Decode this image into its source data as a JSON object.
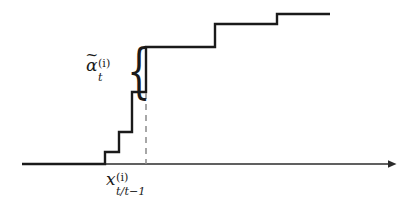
{
  "figure": {
    "background_color": "#ffffff",
    "line_color": "#1a1a1a",
    "dashed_line_color": "#7a7a7a",
    "axis_color": "#2b2b2b"
  },
  "labels": {
    "alpha": {
      "name": "alpha-tilde-label",
      "base": "α",
      "accent": "~",
      "subscript": "t",
      "superscript": "(i)",
      "plain": "α̃_t^(i)"
    },
    "x_pred": {
      "name": "x-predicted-label",
      "base": "x",
      "subscript": "t/t−1",
      "superscript": "(i)",
      "plain": "x_{t/t−1}^{(i)}"
    }
  },
  "brace": {
    "name": "curly-brace",
    "glyph": "{",
    "top_y": 47,
    "bottom_y": 93
  },
  "chart_data": {
    "type": "line",
    "xlabel": "",
    "ylabel": "",
    "grid": false,
    "legend": false,
    "axis": {
      "x_start": 22,
      "x_end": 396,
      "y": 164,
      "arrow": true
    },
    "marked_x": {
      "label": "x_{t/t−1}^{(i)}",
      "pixel_x": 146,
      "dashed_from_y": 92,
      "dashed_to_y": 164
    },
    "highlighted_jump": {
      "label": "α̃_t^(i)",
      "from_y": 92,
      "to_y": 47,
      "at_x": 146
    },
    "step_points_px": [
      [
        22,
        164
      ],
      [
        105,
        164
      ],
      [
        105,
        152
      ],
      [
        119,
        152
      ],
      [
        119,
        132
      ],
      [
        132,
        132
      ],
      [
        132,
        92
      ],
      [
        146,
        92
      ],
      [
        146,
        47
      ],
      [
        215,
        47
      ],
      [
        215,
        24
      ],
      [
        277,
        24
      ],
      [
        277,
        14
      ],
      [
        330,
        14
      ]
    ],
    "steps": [
      {
        "x": 105,
        "y_from": 164,
        "y_to": 152
      },
      {
        "x": 119,
        "y_from": 152,
        "y_to": 132
      },
      {
        "x": 132,
        "y_from": 132,
        "y_to": 92
      },
      {
        "x": 146,
        "y_from": 92,
        "y_to": 47
      },
      {
        "x": 215,
        "y_from": 47,
        "y_to": 24
      },
      {
        "x": 277,
        "y_from": 24,
        "y_to": 14
      }
    ]
  }
}
